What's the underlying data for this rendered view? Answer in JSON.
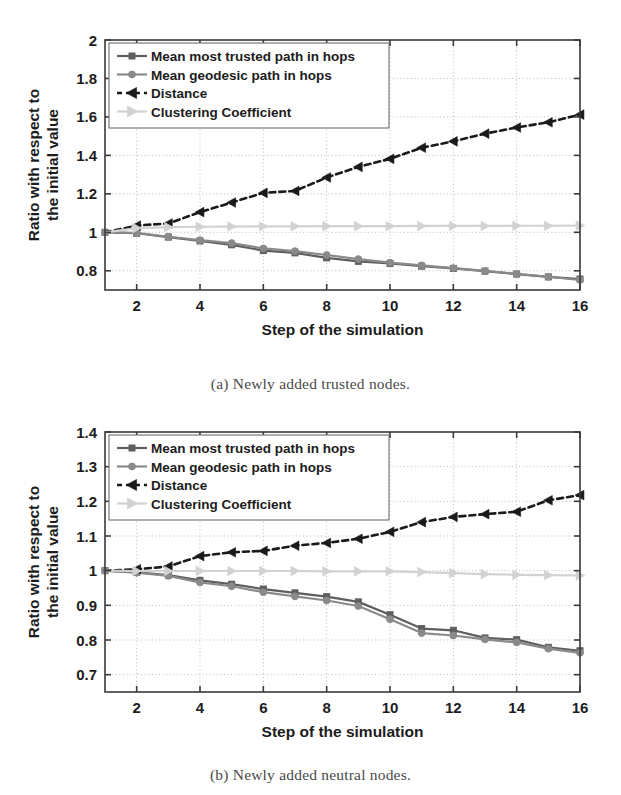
{
  "figure": {
    "captions": {
      "a": "(a) Newly added trusted nodes.",
      "b": "(b) Newly added neutral nodes."
    }
  },
  "colors": {
    "most_trusted": "#5e5e5e",
    "geodesic": "#8a8a8a",
    "distance": "#1a1a1a",
    "clustering": "#d2d2d2",
    "axis": "#3a3a3a",
    "grid": "#b9b9b9",
    "background": "#ffffff"
  },
  "legend": {
    "items": [
      {
        "label": "Mean most trusted path in hops",
        "marker": "square-marker",
        "style": "solid"
      },
      {
        "label": "Mean geodesic path in hops",
        "marker": "circle-marker",
        "style": "solid"
      },
      {
        "label": "Distance",
        "marker": "triangle-left-marker",
        "style": "dashed"
      },
      {
        "label": "Clustering Coefficient",
        "marker": "triangle-right-marker",
        "style": "solid"
      }
    ]
  },
  "chart_data": [
    {
      "id": "chart-a",
      "type": "line",
      "title": "",
      "caption": "(a) Newly added trusted nodes.",
      "xlabel": "Step of the simulation",
      "ylabel": "Ratio with respect to the initial value",
      "x": [
        1,
        2,
        3,
        4,
        5,
        6,
        7,
        8,
        9,
        10,
        11,
        12,
        13,
        14,
        15,
        16
      ],
      "xlim": [
        1,
        16
      ],
      "ylim": [
        0.7,
        2
      ],
      "xticks": [
        2,
        4,
        6,
        8,
        10,
        12,
        14,
        16
      ],
      "yticks": [
        0.8,
        1,
        1.2,
        1.4,
        1.6,
        1.8,
        2
      ],
      "yticklabels": [
        "0.8",
        "1",
        "1.2",
        "1.4",
        "1.6",
        "1.8",
        "2"
      ],
      "xticklabels": [
        "2",
        "4",
        "6",
        "8",
        "10",
        "12",
        "14",
        "16"
      ],
      "grid": true,
      "legend_position": "upper-left",
      "series": [
        {
          "name": "Mean most trusted path in hops",
          "color": "#5e5e5e",
          "marker": "square",
          "style": "solid",
          "values": [
            1.0,
            0.995,
            0.975,
            0.955,
            0.935,
            0.905,
            0.893,
            0.867,
            0.849,
            0.838,
            0.824,
            0.812,
            0.798,
            0.783,
            0.768,
            0.757
          ]
        },
        {
          "name": "Mean geodesic path in hops",
          "color": "#8a8a8a",
          "marker": "circle",
          "style": "solid",
          "values": [
            1.0,
            0.997,
            0.977,
            0.959,
            0.944,
            0.916,
            0.902,
            0.882,
            0.861,
            0.842,
            0.828,
            0.814,
            0.799,
            0.784,
            0.769,
            0.752
          ]
        },
        {
          "name": "Distance",
          "color": "#1a1a1a",
          "marker": "triangle-left",
          "style": "dashed",
          "values": [
            1.0,
            1.035,
            1.046,
            1.105,
            1.155,
            1.205,
            1.215,
            1.285,
            1.34,
            1.382,
            1.44,
            1.473,
            1.513,
            1.545,
            1.572,
            1.612
          ]
        },
        {
          "name": "Clustering Coefficient",
          "color": "#d2d2d2",
          "marker": "triangle-right",
          "style": "solid",
          "values": [
            1.0,
            1.022,
            1.027,
            1.029,
            1.03,
            1.031,
            1.031,
            1.032,
            1.032,
            1.032,
            1.033,
            1.033,
            1.033,
            1.034,
            1.034,
            1.035
          ]
        }
      ]
    },
    {
      "id": "chart-b",
      "type": "line",
      "title": "",
      "caption": "(b) Newly added neutral nodes.",
      "xlabel": "Step of the simulation",
      "ylabel": "Ratio with respect to the initial value",
      "x": [
        1,
        2,
        3,
        4,
        5,
        6,
        7,
        8,
        9,
        10,
        11,
        12,
        13,
        14,
        15,
        16
      ],
      "xlim": [
        1,
        16
      ],
      "ylim": [
        0.65,
        1.4
      ],
      "xticks": [
        2,
        4,
        6,
        8,
        10,
        12,
        14,
        16
      ],
      "yticks": [
        0.7,
        0.8,
        0.9,
        1,
        1.1,
        1.2,
        1.3,
        1.4
      ],
      "yticklabels": [
        "0.7",
        "0.8",
        "0.9",
        "1",
        "1.1",
        "1.2",
        "1.3",
        "1.4"
      ],
      "xticklabels": [
        "2",
        "4",
        "6",
        "8",
        "10",
        "12",
        "14",
        "16"
      ],
      "grid": true,
      "legend_position": "upper-left",
      "series": [
        {
          "name": "Mean most trusted path in hops",
          "color": "#5e5e5e",
          "marker": "square",
          "style": "solid",
          "values": [
            1.0,
            0.995,
            0.987,
            0.972,
            0.961,
            0.947,
            0.936,
            0.925,
            0.91,
            0.873,
            0.833,
            0.828,
            0.806,
            0.801,
            0.779,
            0.769
          ]
        },
        {
          "name": "Mean geodesic path in hops",
          "color": "#8a8a8a",
          "marker": "circle",
          "style": "solid",
          "values": [
            1.0,
            0.994,
            0.985,
            0.966,
            0.955,
            0.938,
            0.926,
            0.914,
            0.898,
            0.86,
            0.82,
            0.813,
            0.802,
            0.793,
            0.775,
            0.763
          ]
        },
        {
          "name": "Distance",
          "color": "#1a1a1a",
          "marker": "triangle-left",
          "style": "dashed",
          "values": [
            1.0,
            1.004,
            1.012,
            1.042,
            1.053,
            1.057,
            1.072,
            1.08,
            1.092,
            1.112,
            1.14,
            1.155,
            1.163,
            1.17,
            1.203,
            1.218
          ]
        },
        {
          "name": "Clustering Coefficient",
          "color": "#d2d2d2",
          "marker": "triangle-right",
          "style": "solid",
          "values": [
            1.0,
            0.999,
            0.999,
            0.999,
            0.999,
            0.999,
            0.999,
            0.998,
            0.998,
            0.998,
            0.996,
            0.993,
            0.99,
            0.988,
            0.987,
            0.986
          ]
        }
      ]
    }
  ]
}
